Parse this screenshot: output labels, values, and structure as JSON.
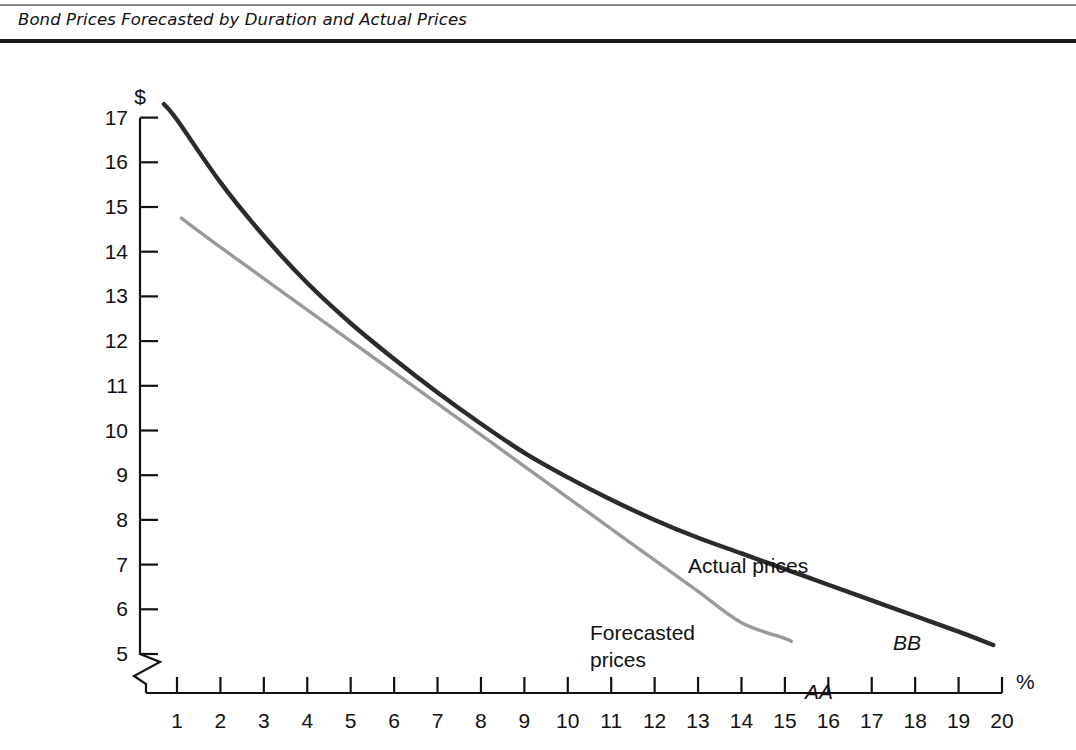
{
  "caption": {
    "title": "Bond Prices Forecasted by Duration and Actual Prices"
  },
  "chart_data": {
    "type": "line",
    "title": "Bond Prices Forecasted by Duration and Actual Prices",
    "xlabel": "%",
    "ylabel": "$",
    "xlim": [
      0,
      20
    ],
    "ylim": [
      5,
      17
    ],
    "x_ticks": [
      "1",
      "2",
      "3",
      "4",
      "5",
      "6",
      "7",
      "8",
      "9",
      "10",
      "11",
      "12",
      "13",
      "14",
      "15",
      "16",
      "17",
      "18",
      "19",
      "20"
    ],
    "y_ticks": [
      "5",
      "6",
      "7",
      "8",
      "9",
      "10",
      "11",
      "12",
      "13",
      "14",
      "15",
      "16",
      "17"
    ],
    "grid": false,
    "legend_position": "inline-annotations",
    "y_axis_break": true,
    "x_axis_break": true,
    "series": [
      {
        "name": "Actual prices",
        "code": "BB",
        "color": "#2b2b2b",
        "x": [
          0.7,
          1,
          2,
          3,
          4,
          5,
          6,
          7,
          8,
          9,
          10,
          11,
          12,
          13,
          14,
          15,
          16,
          17,
          18,
          19,
          19.8
        ],
        "values": [
          17.3,
          16.95,
          15.55,
          14.35,
          13.3,
          12.4,
          11.6,
          10.85,
          10.15,
          9.5,
          8.95,
          8.45,
          8.0,
          7.6,
          7.25,
          6.9,
          6.55,
          6.2,
          5.85,
          5.5,
          5.2
        ]
      },
      {
        "name": "Forecasted prices",
        "code": "AA",
        "color": "#9a9a9a",
        "x": [
          1.1,
          2,
          3,
          4,
          5,
          6,
          7,
          8,
          9,
          10,
          11,
          12,
          13,
          14,
          15,
          15.15
        ],
        "values": [
          14.75,
          14.1,
          13.4,
          12.7,
          12.0,
          11.3,
          10.6,
          9.9,
          9.2,
          8.5,
          7.8,
          7.1,
          6.4,
          5.7,
          5.35,
          5.28
        ]
      }
    ],
    "annotations": [
      {
        "text": "Actual prices",
        "x_px": 688,
        "y_px": 527
      },
      {
        "text": "Forecasted prices",
        "x_px": 590,
        "y_px": 594
      },
      {
        "text": "BB",
        "x_px": 893,
        "y_px": 604
      },
      {
        "text": "AA",
        "x_px": 805,
        "y_px": 653
      }
    ]
  },
  "axes": {
    "y_unit": "$",
    "x_unit": "%"
  },
  "series_labels": {
    "actual": "Actual prices",
    "forecast_line1": "Forecasted",
    "forecast_line2": "prices",
    "bb": "BB",
    "aa": "AA"
  }
}
